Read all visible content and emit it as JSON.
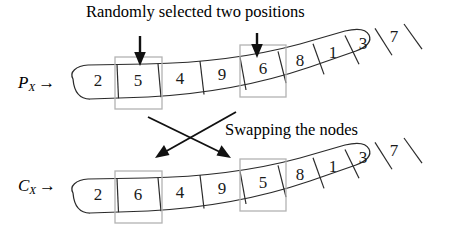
{
  "figure": {
    "title_caption": "Randomly selected two positions",
    "swap_caption": "Swapping the nodes",
    "highlight_color": "#b3b3b3",
    "stroke_color": "#2b2b2b",
    "arrow_color": "#111111"
  },
  "parent": {
    "label_main": "P",
    "label_sub": "X",
    "label_arrow": "→",
    "genes": [
      "2",
      "5",
      "4",
      "9",
      "6",
      "8",
      "1",
      "3",
      "7"
    ],
    "selected_indices": [
      1,
      4
    ],
    "selected_values": [
      "5",
      "6"
    ]
  },
  "child": {
    "label_main": "C",
    "label_sub": "X",
    "label_arrow": "→",
    "genes": [
      "2",
      "6",
      "4",
      "9",
      "5",
      "8",
      "1",
      "3",
      "7"
    ],
    "selected_indices": [
      1,
      4
    ],
    "selected_values": [
      "6",
      "5"
    ]
  },
  "markers": {
    "down_arrow_1": "down-arrow",
    "down_arrow_2": "down-arrow",
    "swap_arrow_1": "diagonal-arrow",
    "swap_arrow_2": "diagonal-arrow"
  }
}
